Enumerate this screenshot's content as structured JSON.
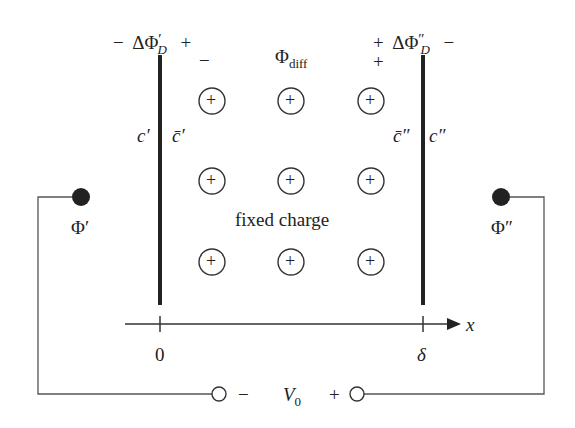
{
  "diagram": {
    "type": "membrane-potential-schematic",
    "left_membrane_top": {
      "minus": "−",
      "label": "ΔΦ",
      "prime": "′",
      "subscript": "D",
      "plus": "+"
    },
    "right_membrane_top": {
      "plus": "+",
      "label": "ΔΦ",
      "prime": "″",
      "subscript": "D",
      "minus": "−"
    },
    "left_inner_sign": "−",
    "right_inner_sign": "+",
    "center_top": {
      "symbol": "Φ",
      "subscript": "diff"
    },
    "left_concentrations": {
      "outer": "c′",
      "inner": "c̄′"
    },
    "right_concentrations": {
      "inner": "c̄″",
      "outer": "c″"
    },
    "fixed_charge_label": "fixed charge",
    "fixed_charge_symbol": "+",
    "fixed_charge_grid": {
      "rows": 3,
      "cols": 3
    },
    "left_electrode_label": "Φ′",
    "right_electrode_label": "Φ″",
    "axis": {
      "label": "x",
      "ticks": [
        "0",
        "δ"
      ]
    },
    "source": {
      "minus": "−",
      "label": "V",
      "subscript": "0",
      "plus": "+"
    }
  }
}
